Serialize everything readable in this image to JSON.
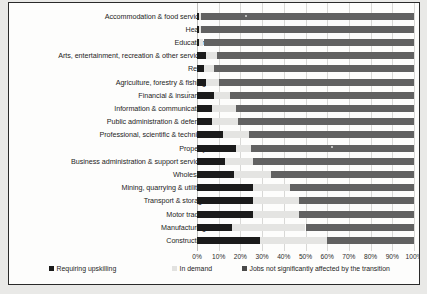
{
  "chart_data": {
    "type": "bar",
    "orientation": "horizontal",
    "stacked": true,
    "stack_mode": "percent",
    "title": "",
    "subtitle": "",
    "xlabel": "",
    "ylabel": "",
    "xlim": [
      0,
      100
    ],
    "xticks": [
      "0%",
      "10%",
      "20%",
      "30%",
      "40%",
      "50%",
      "60%",
      "70%",
      "80%",
      "90%",
      "100%"
    ],
    "xtick_values": [
      0,
      10,
      20,
      30,
      40,
      50,
      60,
      70,
      80,
      90,
      100
    ],
    "grid": true,
    "grid_axis": "x",
    "legend_position": "bottom",
    "categories": [
      "Accommodation & food services",
      "Health",
      "Education",
      "Arts, entertainment, recreation & other services",
      "Retail",
      "Agriculture, forestry & fishing",
      "Financial & insurance",
      "Information & communication",
      "Public administration & defence",
      "Professional, scientific & technical",
      "Property",
      "Business administration & support services",
      "Wholesale",
      "Mining, quarrying & utilities",
      "Transport & storage",
      "Motor trades",
      "Manufacturing",
      "Construction"
    ],
    "series": [
      {
        "name": "Requiring upskilling",
        "color": "#1b1b1b",
        "values": [
          1,
          1,
          1,
          4,
          3,
          4,
          8,
          7,
          7,
          12,
          18,
          13,
          17,
          26,
          26,
          26,
          16,
          29
        ]
      },
      {
        "name": "In demand",
        "color": "#e4e4e2",
        "values": [
          1,
          1,
          2,
          5,
          5,
          6,
          7,
          11,
          12,
          12,
          7,
          13,
          17,
          17,
          21,
          21,
          34,
          31
        ]
      },
      {
        "name": "Jobs not significantly affected by the transition",
        "color": "#616161",
        "values": [
          98,
          98,
          97,
          91,
          92,
          90,
          85,
          82,
          81,
          76,
          75,
          74,
          66,
          57,
          53,
          53,
          50,
          40
        ]
      }
    ]
  },
  "legend": {
    "items": [
      {
        "label": "Requiring upskilling"
      },
      {
        "label": "In demand"
      },
      {
        "label": "Jobs not significantly affected by the transition"
      }
    ]
  }
}
